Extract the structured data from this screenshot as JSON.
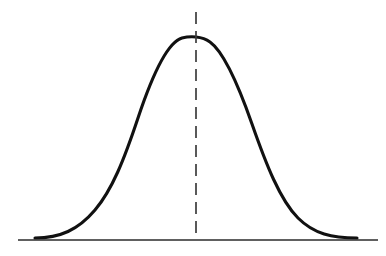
{
  "figure": {
    "name": "bell-curve-figure",
    "background_color": "#ffffff",
    "width": 386,
    "height": 256
  },
  "chart_data": {
    "type": "line",
    "title": "",
    "subtitle": "",
    "xlabel": "",
    "ylabel": "",
    "grid": false,
    "legend": null,
    "legend_position": "none",
    "distribution": "normal",
    "mean": 0,
    "std_dev": 1,
    "xlim": [
      -4,
      4
    ],
    "ylim": [
      0,
      1
    ],
    "x": [
      -4,
      -3.75,
      -3.5,
      -3.25,
      -3,
      -2.75,
      -2.5,
      -2.25,
      -2,
      -1.75,
      -1.5,
      -1.25,
      -1,
      -0.75,
      -0.5,
      -0.25,
      0,
      0.25,
      0.5,
      0.75,
      1,
      1.25,
      1.5,
      1.75,
      2,
      2.25,
      2.5,
      2.75,
      3,
      3.25,
      3.5,
      3.75,
      4
    ],
    "y": [
      0.0003,
      0.0009,
      0.0022,
      0.0051,
      0.0111,
      0.0228,
      0.0439,
      0.0796,
      0.1353,
      0.2163,
      0.3247,
      0.4578,
      0.6065,
      0.7548,
      0.8825,
      0.9692,
      1.0,
      0.9692,
      0.8825,
      0.7548,
      0.6065,
      0.4578,
      0.3247,
      0.2163,
      0.1353,
      0.0796,
      0.0439,
      0.0228,
      0.0111,
      0.0051,
      0.0022,
      0.0009,
      0.0003
    ],
    "series": [
      {
        "name": "normal-density",
        "color": "#111111",
        "line_width": 3.1,
        "values": [
          0.0003,
          0.0009,
          0.0022,
          0.0051,
          0.0111,
          0.0228,
          0.0439,
          0.0796,
          0.1353,
          0.2163,
          0.3247,
          0.4578,
          0.6065,
          0.7548,
          0.8825,
          0.9692,
          1.0,
          0.9692,
          0.8825,
          0.7548,
          0.6065,
          0.4578,
          0.3247,
          0.2163,
          0.1353,
          0.0796,
          0.0439,
          0.0228,
          0.0111,
          0.0051,
          0.0022,
          0.0009,
          0.0003
        ]
      }
    ],
    "annotations": [
      {
        "name": "mean-line",
        "type": "vline",
        "x": 0,
        "style": "dashed",
        "color": "#3d3d3d",
        "label": ""
      }
    ],
    "peak_point": {
      "x": 0,
      "y": 1.0
    },
    "tick_labels": {
      "x": [],
      "y": []
    }
  },
  "geometry": {
    "curve_path": "M 35 238 C 60 238 78 230 95 210 C 112 190 124 160 138 118 C 152 76 168 42 182 38 C 190 36 202 36 210 42 C 224 52 238 84 252 124 C 266 164 280 200 298 218 C 314 234 332 238 357 238",
    "baseline": {
      "x1": 18,
      "y1": 240,
      "x2": 378,
      "y2": 240
    },
    "mean_line": {
      "x": 196,
      "y_top": 12,
      "y_bottom": 238
    }
  }
}
